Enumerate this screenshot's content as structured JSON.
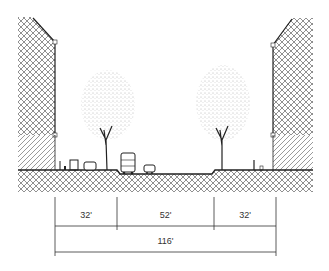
{
  "diagram": {
    "type": "street-section",
    "colors": {
      "ink": "#222222",
      "hatch": "#555555",
      "background": "#ffffff"
    },
    "elements": {
      "left_building": {
        "hatch": "crosshatch",
        "base_hatch": "diagonal"
      },
      "right_building": {
        "hatch": "crosshatch",
        "base_hatch": "diagonal"
      },
      "trees": 2,
      "vehicles": [
        "car",
        "bus",
        "car"
      ],
      "pedestrians": 2
    },
    "dimensions": {
      "segments": [
        {
          "label": "32'"
        },
        {
          "label": "52'"
        },
        {
          "label": "32'"
        }
      ],
      "total": {
        "label": "116'"
      }
    }
  }
}
